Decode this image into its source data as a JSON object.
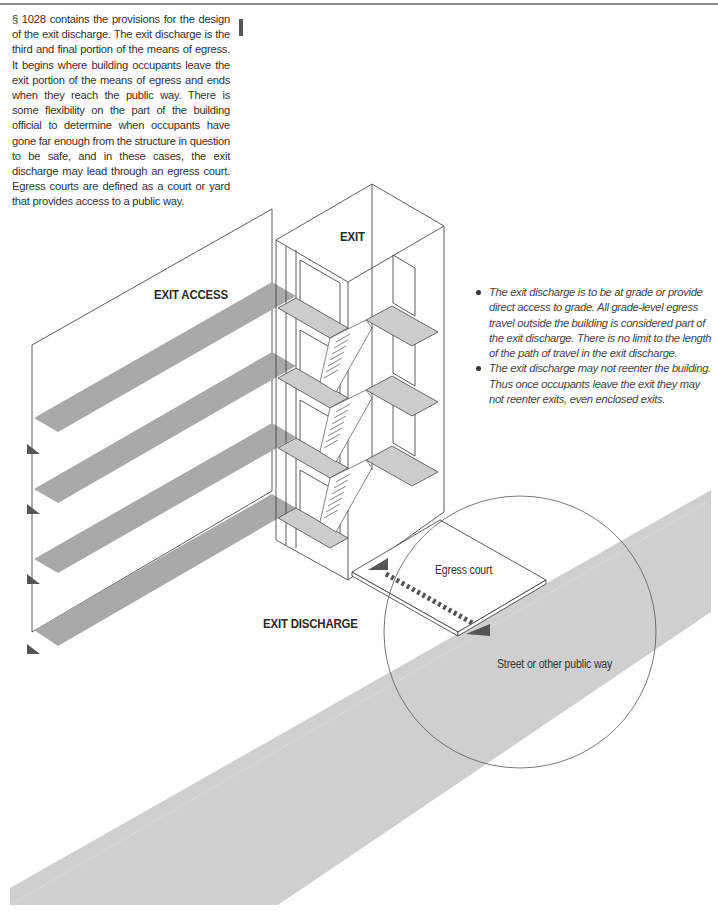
{
  "header": {
    "rule": true
  },
  "intro_paragraph": "§ 1028 contains the provisions for the design of the exit discharge. The exit discharge is the third and final portion of the means of egress. It begins where building occupants leave the exit portion of the means of egress and ends when they reach the public way. There is some flexibility on the part of the building official to determine when occupants have gone far enough from the structure in question to be safe, and in these cases, the exit discharge may lead through an egress court. Egress courts are defined as a court or yard that provides access to a public way.",
  "bullets": [
    "The exit discharge is to be at grade or provide direct access to grade. All grade-level egress travel outside the building is considered part of the exit discharge. There is no limit to the length of the path of travel in the exit discharge.",
    "The exit discharge may not reenter the building. Thus once occupants leave the exit they may not reenter exits, even enclosed exits."
  ],
  "diagram": {
    "labels": {
      "exit": "EXIT",
      "exit_access": "EXIT ACCESS",
      "exit_discharge": "EXIT DISCHARGE",
      "egress_court": "Egress court",
      "street": "Street or other public way"
    },
    "colors": {
      "path_gray": "#a9a9a9",
      "street_gray": "#cfcfcf",
      "floor_gray": "#cccccc",
      "arrow_dark": "#555555",
      "line": "#333333"
    },
    "floors": 4
  }
}
